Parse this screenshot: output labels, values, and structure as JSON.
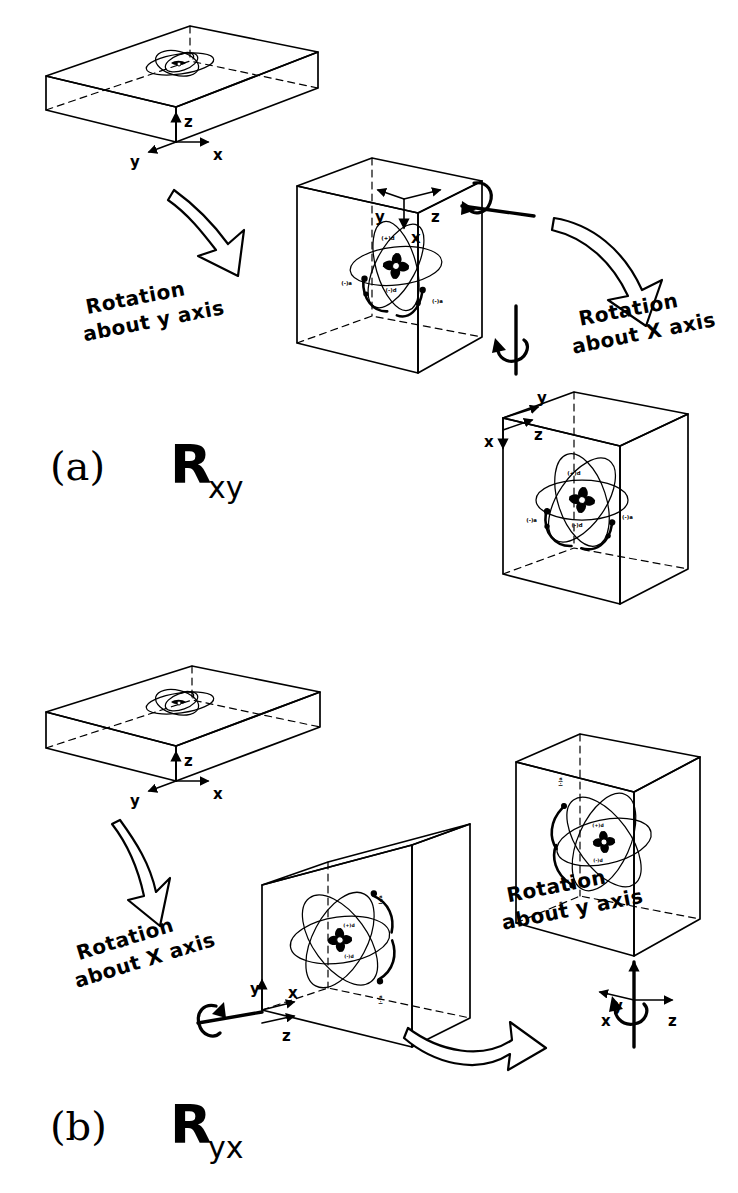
{
  "figure": {
    "background_color": "#ffffff",
    "ink_color": "#000000"
  },
  "panels": [
    {
      "id": "a",
      "panel_label": "(a)",
      "operator_symbol": "R",
      "operator_subscript": "xy",
      "steps": [
        {
          "name": "initial-slab",
          "shape": "flat-slab",
          "axes": [
            {
              "label": "z",
              "direction": "up"
            },
            {
              "label": "y",
              "direction": "left"
            },
            {
              "label": "x",
              "direction": "right"
            }
          ]
        },
        {
          "name": "after-y-rotation-box",
          "shape": "upright-box",
          "axes": [
            {
              "label": "y",
              "direction": "left"
            },
            {
              "label": "z",
              "direction": "right"
            },
            {
              "label": "x",
              "direction": "down"
            }
          ],
          "orbital_labels": [
            "(+)d",
            "(-)d",
            "(-)a",
            "(-)a"
          ]
        },
        {
          "name": "after-x-rotation-box",
          "shape": "upright-box",
          "axes": [
            {
              "label": "y",
              "direction": "right"
            },
            {
              "label": "z",
              "direction": "right-down"
            },
            {
              "label": "x",
              "direction": "down"
            }
          ],
          "orbital_labels": [
            "(+)d",
            "(-)d",
            "(-)a",
            "(-)a"
          ]
        }
      ],
      "transitions": [
        {
          "name": "rotation-about-y",
          "line1": "Rotation",
          "line2": "about y axis",
          "arrow": "big-hollow-arrow-down-right",
          "axis_icon": "horizontal-rod-with-circular-arrow"
        },
        {
          "name": "rotation-about-x",
          "line1": "Rotation",
          "line2": "about X axis",
          "arrow": "big-hollow-arrow-curved-down",
          "axis_icon": "vertical-rod-with-circular-arrow"
        }
      ]
    },
    {
      "id": "b",
      "panel_label": "(b)",
      "operator_symbol": "R",
      "operator_subscript": "yx",
      "steps": [
        {
          "name": "initial-slab",
          "shape": "flat-slab",
          "axes": [
            {
              "label": "z",
              "direction": "up"
            },
            {
              "label": "y",
              "direction": "left"
            },
            {
              "label": "x",
              "direction": "right"
            }
          ]
        },
        {
          "name": "after-x-rotation-box",
          "shape": "upright-box",
          "axes": [
            {
              "label": "y",
              "direction": "up"
            },
            {
              "label": "x",
              "direction": "right"
            },
            {
              "label": "z",
              "direction": "down-right"
            }
          ],
          "orbital_labels": [
            "(+)d",
            "(-)d",
            "(-)a",
            "(-)a"
          ]
        },
        {
          "name": "after-y-rotation-box",
          "shape": "upright-box",
          "axes": [
            {
              "label": "y",
              "direction": "up"
            },
            {
              "label": "x",
              "direction": "left"
            },
            {
              "label": "z",
              "direction": "right"
            }
          ],
          "orbital_labels": [
            "(+)d",
            "(-)d",
            "(-)a",
            "(-)a"
          ]
        }
      ],
      "transitions": [
        {
          "name": "rotation-about-x",
          "line1": "Rotation",
          "line2": "about X axis",
          "arrow": "big-hollow-arrow-down",
          "axis_icon": "horizontal-rod-with-circular-arrow"
        },
        {
          "name": "rotation-about-y",
          "line1": "Rotation",
          "line2": "about y axis",
          "arrow": "big-hollow-arrow-right",
          "axis_icon": "vertical-rod-with-circular-arrow"
        }
      ]
    }
  ],
  "labels": {
    "panel_a": "(a)",
    "panel_b": "(b)",
    "R": "R",
    "sub_xy": "xy",
    "sub_yx": "yx",
    "rotation": "Rotation",
    "about_y_axis": "about y axis",
    "about_x_axis": "about X axis",
    "axis_x": "x",
    "axis_y": "y",
    "axis_z": "z",
    "orb_plus_d": "(+)d",
    "orb_minus_d": "(-)d",
    "orb_minus_a": "(-)a",
    "orb_minus_a2": "(-)a"
  }
}
